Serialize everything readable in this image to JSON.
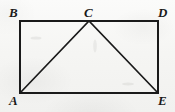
{
  "figure": {
    "kind": "geometry-diagram",
    "background_color": "#f7f7f5",
    "ink_color": "#1a1a1a",
    "canvas": {
      "width": 175,
      "height": 112
    },
    "vertices": [
      {
        "id": "B",
        "label": "B",
        "x": 20,
        "y": 21,
        "role": "rectangle-top-left"
      },
      {
        "id": "C",
        "label": "C",
        "x": 89,
        "y": 21,
        "role": "triangle-apex-on-top-edge"
      },
      {
        "id": "D",
        "label": "D",
        "x": 158,
        "y": 21,
        "role": "rectangle-top-right"
      },
      {
        "id": "A",
        "label": "A",
        "x": 20,
        "y": 93,
        "role": "rectangle-bottom-left"
      },
      {
        "id": "E",
        "label": "E",
        "x": 158,
        "y": 93,
        "role": "rectangle-bottom-right"
      }
    ],
    "shapes": [
      {
        "name": "rectangle-ABDE",
        "type": "rectangle",
        "points": "20,21 158,21 158,93 20,93",
        "stroke_width": 2.0
      },
      {
        "name": "triangle-ACE",
        "type": "polyline",
        "points": "20,93 89,21 158,93",
        "stroke_width": 1.7
      }
    ],
    "segments": [
      {
        "name": "BD",
        "from": "B",
        "to": "D"
      },
      {
        "name": "DE",
        "from": "D",
        "to": "E"
      },
      {
        "name": "EA",
        "from": "E",
        "to": "A"
      },
      {
        "name": "AB",
        "from": "A",
        "to": "B"
      },
      {
        "name": "AC",
        "from": "A",
        "to": "C"
      },
      {
        "name": "CE",
        "from": "C",
        "to": "E"
      }
    ]
  }
}
